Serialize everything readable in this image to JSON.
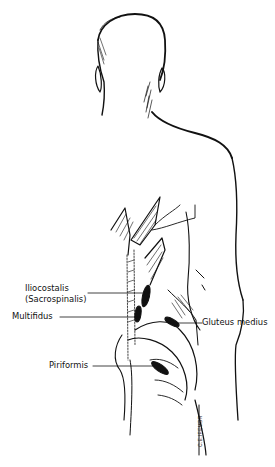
{
  "figure": {
    "labels": {
      "iliocostalis_line1": "Iliocostalis",
      "iliocostalis_line2": "(Sacrospinalis)",
      "multifidus": "Multifidus",
      "gluteus_medius": "Gluteus medius",
      "piriformis": "Piriformis"
    },
    "signature": "C.E.IFEMBR",
    "colors": {
      "ink": "#111111",
      "background": "#ffffff"
    }
  }
}
